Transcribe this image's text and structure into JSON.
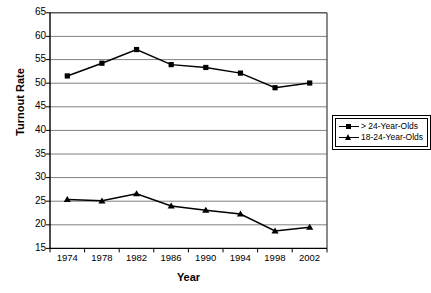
{
  "chart_data": {
    "type": "line",
    "title": "",
    "xlabel": "Year",
    "ylabel": "Turnout Rate",
    "x": [
      1974,
      1978,
      1982,
      1986,
      1990,
      1994,
      1998,
      2002
    ],
    "categories": [
      "1974",
      "1978",
      "1982",
      "1986",
      "1990",
      "1994",
      "1998",
      "2002"
    ],
    "xtick_labels": [
      "1974",
      "1978",
      "1982",
      "1986",
      "1990",
      "1994",
      "1998",
      "2002"
    ],
    "ytick_labels": [
      "15",
      "20",
      "25",
      "30",
      "35",
      "40",
      "45",
      "50",
      "55",
      "60",
      "65"
    ],
    "ytick_values": [
      15,
      20,
      25,
      30,
      35,
      40,
      45,
      50,
      55,
      60,
      65
    ],
    "ylim": [
      15,
      65
    ],
    "grid": "horizontal",
    "legend_position": "right",
    "series": [
      {
        "name": "> 24-Year-Olds",
        "marker": "square",
        "color": "#000000",
        "values": [
          51.6,
          54.3,
          57.2,
          54.0,
          53.4,
          52.2,
          49.1,
          50.1
        ]
      },
      {
        "name": "18-24-Year-Olds",
        "marker": "triangle",
        "color": "#000000",
        "values": [
          25.4,
          25.1,
          26.6,
          24.0,
          23.1,
          22.3,
          18.7,
          19.5
        ]
      }
    ]
  },
  "legend": {
    "entries": [
      {
        "label": "> 24-Year-Olds",
        "marker": "square"
      },
      {
        "label": "18-24-Year-Olds",
        "marker": "triangle"
      }
    ]
  },
  "axes": {
    "x_title": "Year",
    "y_title": "Turnout Rate"
  }
}
